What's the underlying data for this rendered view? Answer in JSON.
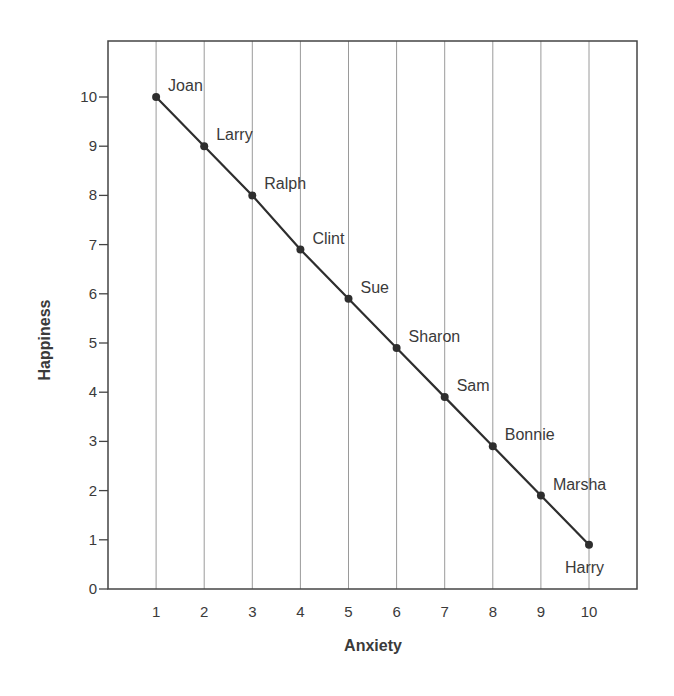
{
  "chart_data": {
    "type": "line",
    "title": "",
    "xlabel": "Anxiety",
    "ylabel": "Happiness",
    "x": [
      1,
      2,
      3,
      4,
      5,
      6,
      7,
      8,
      9,
      10
    ],
    "series": [
      {
        "name": "Anxiety vs Happiness",
        "values": [
          10,
          9,
          8,
          6.9,
          5.9,
          4.9,
          3.9,
          2.9,
          1.9,
          0.9
        ],
        "point_labels": [
          "Joan",
          "Larry",
          "Ralph",
          "Clint",
          "Sue",
          "Sharon",
          "Sam",
          "Bonnie",
          "Marsha",
          "Harry"
        ]
      }
    ],
    "xticks": [
      "1",
      "2",
      "3",
      "4",
      "5",
      "6",
      "7",
      "8",
      "9",
      "10"
    ],
    "yticks": [
      "0",
      "1",
      "2",
      "3",
      "4",
      "5",
      "6",
      "7",
      "8",
      "9",
      "10"
    ],
    "xlim": [
      0,
      11
    ],
    "ylim": [
      0,
      11
    ],
    "grid": {
      "vertical": true,
      "horizontal": false
    },
    "legend": null,
    "colors": {
      "line": "#2e2e2e",
      "grid": "#9a9a9a",
      "frame": "#444444"
    }
  }
}
